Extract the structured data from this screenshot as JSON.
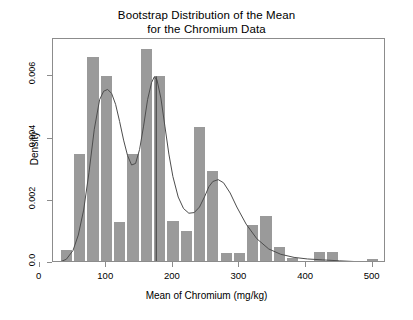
{
  "chart_data": {
    "type": "bar",
    "title": "Bootstrap Distribution of the Mean for the Chromium Data",
    "title_lines": [
      "Bootstrap Distribution of the Mean",
      "for the Chromium Data"
    ],
    "xlabel": "Mean of Chromium (mg/kg)",
    "ylabel": "Density",
    "xlim": [
      20,
      520
    ],
    "ylim": [
      0,
      0.0072
    ],
    "grid": false,
    "legend": false,
    "bar_color": "#9a9a9a",
    "line_color": "#4d4d4d",
    "axis_color": "#8c8c8c",
    "bin_width": 20,
    "xticks": [
      0,
      100,
      200,
      300,
      400,
      500
    ],
    "xtick_labels": [
      "0",
      "100",
      "200",
      "300",
      "400",
      "500"
    ],
    "yticks": [
      0,
      0.002,
      0.004,
      0.006
    ],
    "ytick_labels": [
      "0.0",
      "0.002",
      "0.004",
      "0.006"
    ],
    "categories": [
      40,
      60,
      80,
      100,
      120,
      140,
      160,
      180,
      200,
      220,
      240,
      260,
      280,
      300,
      320,
      340,
      360,
      380,
      400,
      420,
      440,
      460,
      480,
      500
    ],
    "bin_edges": [
      30,
      50,
      70,
      90,
      110,
      130,
      150,
      170,
      190,
      210,
      230,
      250,
      270,
      290,
      310,
      330,
      350,
      370,
      390,
      410,
      430,
      450,
      470,
      490,
      510
    ],
    "values": [
      0.00035,
      0.00345,
      0.00655,
      0.00595,
      0.00125,
      0.00345,
      0.0068,
      0.00595,
      0.0013,
      0.00095,
      0.0043,
      0.0029,
      0.00025,
      0.00025,
      0.00115,
      0.00145,
      0.00045,
      0.0001,
      0.0,
      0.0003,
      0.0003,
      0.0,
      0.0,
      5e-05
    ],
    "reference_line_x": 175,
    "density_curve": {
      "x": [
        30,
        40,
        50,
        58,
        66,
        74,
        82,
        90,
        96,
        102,
        108,
        114,
        120,
        126,
        132,
        138,
        144,
        150,
        156,
        162,
        168,
        172,
        176,
        182,
        188,
        194,
        200,
        208,
        216,
        224,
        232,
        240,
        248,
        254,
        260,
        268,
        276,
        286,
        296,
        310,
        326,
        344,
        362,
        382,
        402,
        425,
        450,
        480,
        510
      ],
      "y": [
        3e-05,
        0.00012,
        0.0004,
        0.0009,
        0.0017,
        0.0029,
        0.0043,
        0.00525,
        0.00552,
        0.00558,
        0.00545,
        0.0051,
        0.00455,
        0.00395,
        0.00345,
        0.00315,
        0.0032,
        0.00365,
        0.0044,
        0.00525,
        0.0058,
        0.00598,
        0.0059,
        0.0053,
        0.0044,
        0.0035,
        0.00278,
        0.00212,
        0.00175,
        0.0016,
        0.00162,
        0.0018,
        0.00215,
        0.00245,
        0.00262,
        0.00268,
        0.00258,
        0.00225,
        0.0018,
        0.00125,
        0.00078,
        0.00045,
        0.00028,
        0.00018,
        0.00013,
        0.0001,
        7e-05,
        4e-05,
        2e-05
      ]
    }
  }
}
